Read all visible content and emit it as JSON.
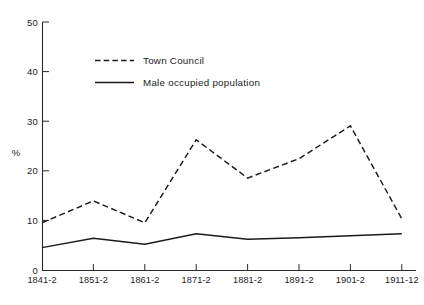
{
  "chart_data": {
    "type": "line",
    "title": "",
    "subtitle": "",
    "xlabel": "",
    "ylabel": "%",
    "ylim": [
      0,
      50
    ],
    "yticks": [
      0,
      10,
      20,
      30,
      40,
      50
    ],
    "ytick_labels": [
      "0",
      "10",
      "20",
      "30",
      "40",
      "50"
    ],
    "grid": false,
    "legend_position": "upper-left-inside",
    "categories": [
      "1841-2",
      "1851-2",
      "1861-2",
      "1871-2",
      "1881-2",
      "1891-2",
      "1901-2",
      "1911-12"
    ],
    "series": [
      {
        "name": "Town Council",
        "style": "dashed",
        "color": "#1a1a1a",
        "values": [
          9.6,
          14.0,
          9.6,
          26.3,
          18.6,
          22.5,
          29.1,
          10.4
        ]
      },
      {
        "name": "Male occupied population",
        "style": "solid",
        "color": "#1a1a1a",
        "values": [
          4.6,
          6.5,
          5.3,
          7.4,
          6.3,
          6.6,
          7.0,
          7.4
        ]
      }
    ]
  },
  "legend": {
    "items": [
      {
        "label": "Town Council",
        "style": "dashed"
      },
      {
        "label": "Male occupied population",
        "style": "solid"
      }
    ]
  },
  "axes": {
    "y_axis_title": "%",
    "y_tick_labels": [
      "50",
      "40",
      "30",
      "20",
      "10",
      "0"
    ],
    "x_tick_labels": [
      "1841-2",
      "1851-2",
      "1861-2",
      "1871-2",
      "1881-2",
      "1891-2",
      "1901-2",
      "1911-12"
    ]
  },
  "colors": {
    "ink": "#1a1a1a",
    "axis": "#2b2b2b",
    "background": "#ffffff"
  }
}
